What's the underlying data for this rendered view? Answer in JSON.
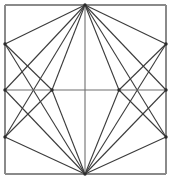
{
  "figure": {
    "background_color": "#ffffff",
    "frame_color": "#8a8a8a",
    "line_color": "#3b3b3b",
    "axis_color": "#6f6f6f",
    "node_color": "#2a2a2a",
    "width": 171,
    "height": 181
  },
  "chart_data": {
    "type": "diagram",
    "xlabel": "",
    "ylabel": "",
    "xlim": [
      0,
      171
    ],
    "ylim": [
      0,
      181
    ],
    "grid": false,
    "legend": "none",
    "frame": {
      "name": "outer-square",
      "x": 5,
      "y": 5,
      "width": 161,
      "height": 169
    },
    "points": [
      {
        "id": "TL",
        "label": "top-left-corner",
        "x": 5,
        "y": 5
      },
      {
        "id": "TC",
        "label": "top-apex",
        "x": 85,
        "y": 5
      },
      {
        "id": "TR",
        "label": "top-right-corner",
        "x": 166,
        "y": 5
      },
      {
        "id": "LU",
        "label": "left-upper-vertex",
        "x": 5,
        "y": 44
      },
      {
        "id": "RU",
        "label": "right-upper-vertex",
        "x": 166,
        "y": 44
      },
      {
        "id": "LM",
        "label": "left-mid-vertex",
        "x": 5,
        "y": 90
      },
      {
        "id": "IL",
        "label": "inner-left-node",
        "x": 52,
        "y": 90
      },
      {
        "id": "IR",
        "label": "inner-right-node",
        "x": 119,
        "y": 90
      },
      {
        "id": "RM",
        "label": "right-mid-vertex",
        "x": 166,
        "y": 90
      },
      {
        "id": "LL",
        "label": "left-lower-vertex",
        "x": 5,
        "y": 137
      },
      {
        "id": "RL",
        "label": "right-lower-vertex",
        "x": 166,
        "y": 137
      },
      {
        "id": "BL",
        "label": "bottom-left-corner",
        "x": 5,
        "y": 174
      },
      {
        "id": "BC",
        "label": "bottom-apex",
        "x": 85,
        "y": 174
      },
      {
        "id": "BR",
        "label": "bottom-right-corner",
        "x": 166,
        "y": 174
      }
    ],
    "edges": [
      {
        "from": "TL",
        "to": "TR",
        "group": "frame"
      },
      {
        "from": "TR",
        "to": "BR",
        "group": "frame"
      },
      {
        "from": "BR",
        "to": "BL",
        "group": "frame"
      },
      {
        "from": "BL",
        "to": "TL",
        "group": "frame"
      },
      {
        "from": "LM",
        "to": "RM",
        "group": "axis"
      },
      {
        "from": "TC",
        "to": "BC",
        "group": "axis"
      },
      {
        "from": "TC",
        "to": "LU",
        "group": "web"
      },
      {
        "from": "TC",
        "to": "RU",
        "group": "web"
      },
      {
        "from": "TC",
        "to": "IL",
        "group": "web"
      },
      {
        "from": "TC",
        "to": "IR",
        "group": "web"
      },
      {
        "from": "TC",
        "to": "LM",
        "group": "web"
      },
      {
        "from": "TC",
        "to": "RM",
        "group": "web"
      },
      {
        "from": "BC",
        "to": "LL",
        "group": "web"
      },
      {
        "from": "BC",
        "to": "RL",
        "group": "web"
      },
      {
        "from": "BC",
        "to": "IL",
        "group": "web"
      },
      {
        "from": "BC",
        "to": "IR",
        "group": "web"
      },
      {
        "from": "BC",
        "to": "LM",
        "group": "web"
      },
      {
        "from": "BC",
        "to": "RM",
        "group": "web"
      },
      {
        "from": "LU",
        "to": "IL",
        "group": "web"
      },
      {
        "from": "RU",
        "to": "IR",
        "group": "web"
      },
      {
        "from": "LL",
        "to": "IL",
        "group": "web"
      },
      {
        "from": "RL",
        "to": "IR",
        "group": "web"
      },
      {
        "from": "LU",
        "to": "BC",
        "group": "web"
      },
      {
        "from": "RU",
        "to": "BC",
        "group": "web"
      },
      {
        "from": "LL",
        "to": "TC",
        "group": "web"
      },
      {
        "from": "RL",
        "to": "TC",
        "group": "web"
      }
    ],
    "nodes_marked": [
      "TC",
      "BC",
      "IL",
      "IR",
      "LM",
      "RM",
      "LU",
      "RU",
      "LL",
      "RL"
    ]
  }
}
